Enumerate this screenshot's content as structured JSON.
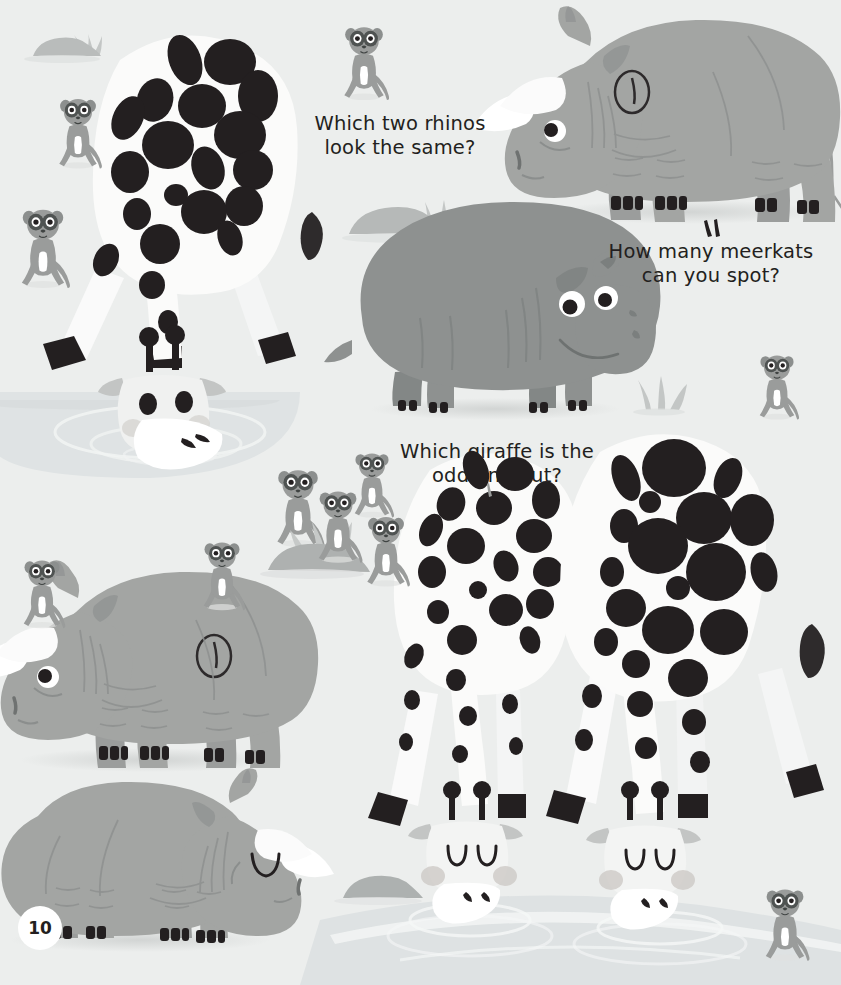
{
  "page": {
    "number": "10",
    "background_color": "#eceeed",
    "width": 841,
    "height": 985
  },
  "palette": {
    "background": "#eceeed",
    "water": "#dfe3e4",
    "water_deep": "#d6dbdc",
    "rhino_body": "#a3a5a3",
    "rhino_shade": "#999b99",
    "hippo_body": "#8e9190",
    "hippo_shade": "#7f8382",
    "meerkat_body": "#9a9c9b",
    "meerkat_dark": "#6f7271",
    "giraffe_body": "#fbfbfa",
    "giraffe_spots": "#231f20",
    "rock": "#b9bcbb",
    "text": "#231f20",
    "horn_white": "#ffffff",
    "hoof_black": "#231f20",
    "cheek": "#c2bfbd",
    "shadow": "#dcdedd"
  },
  "questions": [
    {
      "id": "q-rhinos",
      "text": "Which two rhinos\nlook the same?",
      "line1": "Which two rhinos",
      "line2": "look the same?"
    },
    {
      "id": "q-meerkats",
      "text": "How many meerkats\ncan you spot?",
      "line1": "How many meerkats",
      "line2": "can you spot?"
    },
    {
      "id": "q-giraffe",
      "text": "Which giraffe is the\nodd one out?",
      "line1": "Which giraffe is the",
      "line2": "odd one out?"
    }
  ],
  "animals": {
    "giraffes": [
      {
        "name": "giraffe-top-left-drinking",
        "spot_size": "medium",
        "pose": "drinking",
        "eyes": "open"
      },
      {
        "name": "giraffe-bottom-middle",
        "spot_size": "small",
        "pose": "drinking",
        "eyes": "closed"
      },
      {
        "name": "giraffe-bottom-right",
        "spot_size": "large",
        "pose": "drinking",
        "eyes": "closed"
      }
    ],
    "rhinos": [
      {
        "name": "rhino-top-right",
        "facing": "left",
        "marking": "circle-with-line",
        "eye": "open"
      },
      {
        "name": "rhino-middle-left",
        "facing": "left",
        "marking": "circle-with-line",
        "eye": "open"
      },
      {
        "name": "rhino-bottom-left",
        "facing": "right",
        "marking": "none",
        "eye": "closed"
      }
    ],
    "hippos": [
      {
        "name": "hippo-center",
        "facing": "right",
        "eyes": "open"
      }
    ],
    "meerkat_count_visible": 14
  },
  "scenery": {
    "rocks": [
      "rock-top-left",
      "rock-center-top",
      "rock-meerkat-mound",
      "rock-bottom-center"
    ],
    "leaves": [
      "leaf-upper-center",
      "leaf-right-lower"
    ],
    "grass_tufts": [
      "grass-top-left",
      "grass-center-top",
      "grass-right-mid",
      "grass-meerkat-mound"
    ],
    "water_bodies": [
      "pond-upper-left",
      "pond-bottom"
    ]
  }
}
